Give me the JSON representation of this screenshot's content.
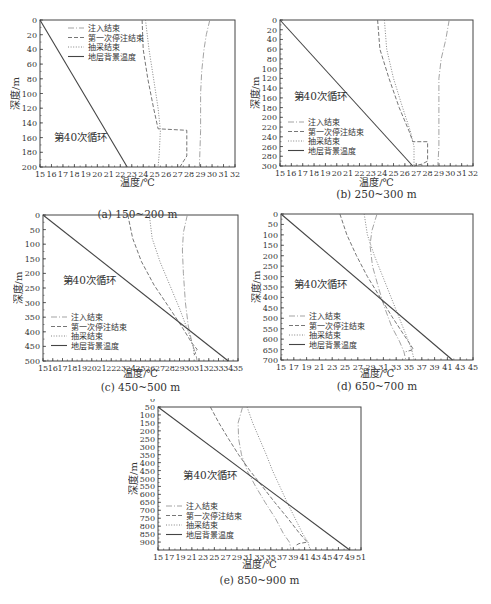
{
  "legend_labels": [
    "注入结束",
    "第一次停注结束",
    "抽采结束",
    "地层背景温度"
  ],
  "cycle_label": "第40次循环",
  "ylabel": "深度/m",
  "xlabel": "温度/℃",
  "colors": {
    "axis": "#444444",
    "background_line": "#444444",
    "injection": "#999999",
    "stop": "#666666",
    "extraction": "#777777"
  },
  "chart_data": [
    {
      "id": "a",
      "type": "line",
      "caption": "(a) 150~200 m",
      "xlabel": "温度/℃",
      "ylabel": "深度/m",
      "xlim": [
        15,
        32
      ],
      "ylim": [
        0,
        200
      ],
      "y_inverted": true,
      "xticks": [
        15,
        16,
        17,
        18,
        19,
        20,
        21,
        22,
        23,
        24,
        25,
        26,
        27,
        28,
        29,
        30,
        31,
        32
      ],
      "yticks": [
        0,
        20,
        40,
        60,
        80,
        100,
        120,
        140,
        160,
        180,
        200
      ],
      "legend_position": "top-left",
      "cycle_label_pos": [
        16.2,
        165
      ],
      "series": [
        {
          "name": "注入结束",
          "style": "dash-dot",
          "points": [
            [
              29.8,
              0
            ],
            [
              29.5,
              20
            ],
            [
              29.3,
              40
            ],
            [
              29.1,
              70
            ],
            [
              29.0,
              100
            ],
            [
              29.0,
              150
            ],
            [
              28.9,
              200
            ]
          ]
        },
        {
          "name": "第一次停注结束",
          "style": "dashed",
          "points": [
            [
              23.9,
              0
            ],
            [
              24.0,
              40
            ],
            [
              24.4,
              80
            ],
            [
              24.9,
              120
            ],
            [
              25.3,
              148
            ],
            [
              27.8,
              150
            ],
            [
              27.8,
              185
            ],
            [
              27.4,
              195
            ],
            [
              27.2,
              200
            ]
          ]
        },
        {
          "name": "抽采结束",
          "style": "dotted",
          "points": [
            [
              24.2,
              0
            ],
            [
              24.5,
              40
            ],
            [
              24.9,
              80
            ],
            [
              25.3,
              120
            ],
            [
              25.5,
              150
            ],
            [
              25.4,
              180
            ],
            [
              25.3,
              200
            ]
          ]
        },
        {
          "name": "地层背景温度",
          "style": "solid",
          "points": [
            [
              15,
              0
            ],
            [
              22.6,
              200
            ]
          ]
        }
      ]
    },
    {
      "id": "b",
      "type": "line",
      "caption": "(b) 250~300 m",
      "xlabel": "温度/℃",
      "ylabel": "深度/m",
      "xlim": [
        15,
        32
      ],
      "ylim": [
        0,
        300
      ],
      "y_inverted": true,
      "xticks": [
        15,
        16,
        17,
        18,
        19,
        20,
        21,
        22,
        23,
        24,
        25,
        26,
        27,
        28,
        29,
        30,
        31,
        32
      ],
      "yticks": [
        0,
        20,
        40,
        60,
        80,
        100,
        120,
        140,
        160,
        180,
        200,
        220,
        240,
        260,
        280,
        300
      ],
      "legend_position": "lower-left",
      "cycle_label_pos": [
        16.2,
        165
      ],
      "series": [
        {
          "name": "注入结束",
          "style": "dash-dot",
          "points": [
            [
              29.9,
              0
            ],
            [
              29.6,
              40
            ],
            [
              29.2,
              80
            ],
            [
              29.0,
              120
            ],
            [
              29.0,
              200
            ],
            [
              29.0,
              260
            ],
            [
              28.9,
              300
            ]
          ]
        },
        {
          "name": "第一次停注结束",
          "style": "dashed",
          "points": [
            [
              23.6,
              0
            ],
            [
              23.8,
              60
            ],
            [
              24.6,
              120
            ],
            [
              25.5,
              180
            ],
            [
              26.4,
              230
            ],
            [
              26.7,
              250
            ],
            [
              28.0,
              250
            ],
            [
              28.0,
              290
            ],
            [
              27.5,
              296
            ],
            [
              26.8,
              300
            ]
          ]
        },
        {
          "name": "抽采结束",
          "style": "dotted",
          "points": [
            [
              24.2,
              0
            ],
            [
              24.4,
              60
            ],
            [
              25.0,
              120
            ],
            [
              25.8,
              180
            ],
            [
              26.5,
              230
            ],
            [
              26.8,
              260
            ],
            [
              26.8,
              300
            ]
          ]
        },
        {
          "name": "地层背景温度",
          "style": "solid",
          "points": [
            [
              15,
              0
            ],
            [
              26.7,
              300
            ]
          ]
        }
      ]
    },
    {
      "id": "c",
      "type": "line",
      "caption": "(c) 450~500 m",
      "xlabel": "温度/℃",
      "ylabel": "深度/m",
      "xlim": [
        15,
        35
      ],
      "ylim": [
        0,
        500
      ],
      "y_inverted": true,
      "xticks": [
        15,
        16,
        17,
        18,
        19,
        20,
        21,
        22,
        23,
        24,
        25,
        26,
        27,
        28,
        29,
        30,
        31,
        32,
        33,
        34,
        35
      ],
      "yticks": [
        0,
        50,
        100,
        150,
        200,
        250,
        300,
        350,
        400,
        450,
        500
      ],
      "legend_position": "lower-left",
      "cycle_label_pos": [
        17.0,
        235
      ],
      "series": [
        {
          "name": "注入结束",
          "style": "dash-dot",
          "points": [
            [
              29.8,
              0
            ],
            [
              29.4,
              60
            ],
            [
              29.3,
              120
            ],
            [
              29.4,
              200
            ],
            [
              29.6,
              300
            ],
            [
              29.9,
              380
            ],
            [
              30.3,
              440
            ],
            [
              30.7,
              480
            ],
            [
              30.8,
              500
            ]
          ]
        },
        {
          "name": "第一次停注结束",
          "style": "dashed",
          "points": [
            [
              23.7,
              0
            ],
            [
              24.2,
              80
            ],
            [
              25.1,
              160
            ],
            [
              26.4,
              240
            ],
            [
              27.8,
              310
            ],
            [
              29.2,
              380
            ],
            [
              30.3,
              440
            ],
            [
              30.8,
              460
            ],
            [
              30.5,
              480
            ]
          ]
        },
        {
          "name": "抽采结束",
          "style": "dotted",
          "points": [
            [
              25.9,
              0
            ],
            [
              26.2,
              80
            ],
            [
              27.0,
              160
            ],
            [
              28.0,
              240
            ],
            [
              29.0,
              320
            ],
            [
              29.9,
              400
            ],
            [
              30.4,
              450
            ],
            [
              30.5,
              480
            ]
          ]
        },
        {
          "name": "地层背景温度",
          "style": "solid",
          "points": [
            [
              15,
              0
            ],
            [
              34.0,
              500
            ]
          ]
        }
      ]
    },
    {
      "id": "d",
      "type": "line",
      "caption": "(d) 650~700 m",
      "xlabel": "温度/℃",
      "ylabel": "深度/m",
      "xlim": [
        15,
        45
      ],
      "ylim": [
        0,
        700
      ],
      "y_inverted": true,
      "xticks": [
        15,
        17,
        19,
        21,
        23,
        25,
        27,
        29,
        31,
        33,
        35,
        37,
        39,
        41,
        43,
        45
      ],
      "yticks": [
        0,
        50,
        100,
        150,
        200,
        250,
        300,
        350,
        400,
        450,
        500,
        550,
        600,
        650,
        700
      ],
      "legend_position": "lower-left",
      "cycle_label_pos": [
        17.0,
        355
      ],
      "series": [
        {
          "name": "注入结束",
          "style": "dash-dot",
          "points": [
            [
              30.0,
              0
            ],
            [
              29.2,
              80
            ],
            [
              28.9,
              150
            ],
            [
              29.3,
              250
            ],
            [
              30.2,
              350
            ],
            [
              31.2,
              450
            ],
            [
              32.3,
              540
            ],
            [
              33.5,
              610
            ],
            [
              34.2,
              660
            ],
            [
              34.5,
              700
            ]
          ]
        },
        {
          "name": "第一次停注结束",
          "style": "dashed",
          "points": [
            [
              24.2,
              0
            ],
            [
              25.3,
              100
            ],
            [
              26.8,
              200
            ],
            [
              28.5,
              300
            ],
            [
              30.5,
              400
            ],
            [
              32.3,
              490
            ],
            [
              34.0,
              570
            ],
            [
              35.3,
              630
            ],
            [
              35.7,
              650
            ],
            [
              34.5,
              660
            ]
          ]
        },
        {
          "name": "抽采结束",
          "style": "dotted",
          "points": [
            [
              28.0,
              0
            ],
            [
              28.5,
              100
            ],
            [
              29.6,
              200
            ],
            [
              30.9,
              300
            ],
            [
              32.2,
              400
            ],
            [
              33.5,
              500
            ],
            [
              34.8,
              600
            ],
            [
              35.5,
              660
            ],
            [
              35.8,
              700
            ]
          ]
        },
        {
          "name": "地层背景温度",
          "style": "solid",
          "points": [
            [
              15,
              0
            ],
            [
              41.8,
              700
            ]
          ]
        }
      ]
    },
    {
      "id": "e",
      "type": "line",
      "caption": "(e) 850~900 m",
      "xlabel": "温度/℃",
      "ylabel": "深度/m",
      "xlim": [
        15,
        51
      ],
      "ylim": [
        50,
        950
      ],
      "y_inverted": true,
      "xticks": [
        15,
        17,
        19,
        21,
        23,
        25,
        27,
        29,
        31,
        33,
        35,
        37,
        39,
        41,
        43,
        45,
        47,
        49,
        51
      ],
      "yticks": [
        0,
        50,
        100,
        150,
        200,
        250,
        300,
        350,
        400,
        450,
        500,
        550,
        600,
        650,
        700,
        750,
        800,
        850,
        900
      ],
      "legend_position": "lower-left",
      "cycle_label_pos": [
        19.5,
        500
      ],
      "series": [
        {
          "name": "注入结束",
          "style": "dash-dot",
          "points": [
            [
              30.0,
              50
            ],
            [
              29.2,
              150
            ],
            [
              29.3,
              250
            ],
            [
              29.8,
              350
            ],
            [
              30.8,
              450
            ],
            [
              32.3,
              550
            ],
            [
              34.0,
              650
            ],
            [
              35.8,
              750
            ],
            [
              37.3,
              850
            ],
            [
              38.3,
              900
            ],
            [
              38.6,
              950
            ]
          ]
        },
        {
          "name": "第一次停注结束",
          "style": "dashed",
          "points": [
            [
              24.3,
              50
            ],
            [
              25.8,
              150
            ],
            [
              27.5,
              250
            ],
            [
              29.3,
              350
            ],
            [
              31.3,
              450
            ],
            [
              33.5,
              550
            ],
            [
              35.7,
              650
            ],
            [
              38.0,
              750
            ],
            [
              40.2,
              850
            ],
            [
              41.5,
              900
            ],
            [
              40.0,
              910
            ],
            [
              39.5,
              920
            ]
          ]
        },
        {
          "name": "抽采结束",
          "style": "dotted",
          "points": [
            [
              30.8,
              50
            ],
            [
              31.8,
              150
            ],
            [
              33.0,
              250
            ],
            [
              34.2,
              350
            ],
            [
              35.3,
              450
            ],
            [
              36.6,
              550
            ],
            [
              37.9,
              650
            ],
            [
              39.3,
              750
            ],
            [
              40.7,
              850
            ],
            [
              41.6,
              900
            ],
            [
              41.9,
              940
            ]
          ]
        },
        {
          "name": "地层背景温度",
          "style": "solid",
          "points": [
            [
              15,
              50
            ],
            [
              49.0,
              950
            ]
          ]
        }
      ]
    }
  ],
  "layout": [
    {
      "id": "a",
      "x": 40,
      "y": 20,
      "w": 195,
      "h": 147,
      "caption_y": 220,
      "xlabel_y": 184
    },
    {
      "id": "b",
      "x": 280,
      "y": 20,
      "w": 193,
      "h": 146,
      "caption_y": 200,
      "xlabel_y": 184
    },
    {
      "id": "c",
      "x": 43,
      "y": 215,
      "w": 195,
      "h": 146,
      "caption_y": 393,
      "xlabel_y": 375
    },
    {
      "id": "d",
      "x": 281,
      "y": 214,
      "w": 192,
      "h": 146,
      "caption_y": 392,
      "xlabel_y": 375
    },
    {
      "id": "e",
      "x": 158,
      "y": 407,
      "w": 203,
      "h": 143,
      "caption_y": 586,
      "xlabel_y": 566
    }
  ]
}
